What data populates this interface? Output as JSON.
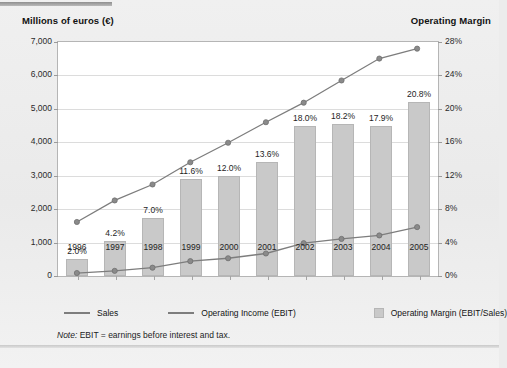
{
  "header": {
    "left_axis_title": "Millions of euros (€)",
    "right_axis_title": "Operating Margin"
  },
  "legend": {
    "sales": "Sales",
    "ebit": "Operating Income (EBIT)",
    "margin": "Operating Margin (EBIT/Sales)"
  },
  "note": {
    "prefix": "Note:",
    "text": "EBIT = earnings before interest and tax."
  },
  "colors": {
    "bar_fill": "#c9c9c9",
    "bar_border": "#b6b6b6",
    "line": "#7d7d7d",
    "marker": "#8a8a8a",
    "grid": "#dcdcdc",
    "plot_bg": "#ffffff",
    "page_bg": "#ededed"
  },
  "chart_data": {
    "type": "bar",
    "title": "",
    "subtitle": "",
    "xlabel": "",
    "ylabel": "Millions of euros (€)",
    "y2label": "Operating Margin",
    "grid": true,
    "legend_position": "bottom",
    "categories": [
      "1996",
      "1997",
      "1998",
      "1999",
      "2000",
      "2001",
      "2002",
      "2003",
      "2004",
      "2005"
    ],
    "ylim": [
      0,
      7000
    ],
    "yticks": [
      0,
      1000,
      2000,
      3000,
      4000,
      5000,
      6000,
      7000
    ],
    "ytick_labels": [
      "0",
      "1,000",
      "2,000",
      "3,000",
      "4,000",
      "5,000",
      "6,000",
      "7,000"
    ],
    "y2lim": [
      0,
      28
    ],
    "y2ticks": [
      0,
      4,
      8,
      12,
      16,
      20,
      24,
      28
    ],
    "y2tick_labels": [
      "0%",
      "4%",
      "8%",
      "12%",
      "16%",
      "20%",
      "24%",
      "28%"
    ],
    "series": [
      {
        "name": "Operating Margin (EBIT/Sales)",
        "type": "bar",
        "axis": "y2",
        "unit": "%",
        "values": [
          2.0,
          4.2,
          7.0,
          11.6,
          12.0,
          13.6,
          18.0,
          18.2,
          17.9,
          20.8
        ],
        "data_labels": [
          "2.0%",
          "4.2%",
          "7.0%",
          "11.6%",
          "12.0%",
          "13.6%",
          "18.0%",
          "18.2%",
          "17.9%",
          "20.8%"
        ]
      },
      {
        "name": "Sales",
        "type": "line",
        "axis": "y1",
        "unit": "millions of euros",
        "values": [
          1570,
          2220,
          2700,
          3370,
          3960,
          4580,
          5170,
          5840,
          6500,
          6800
        ]
      },
      {
        "name": "Operating Income (EBIT)",
        "type": "line",
        "axis": "y1",
        "unit": "millions of euros",
        "values": [
          30,
          95,
          190,
          390,
          475,
          620,
          930,
          1060,
          1165,
          1415
        ]
      }
    ]
  }
}
